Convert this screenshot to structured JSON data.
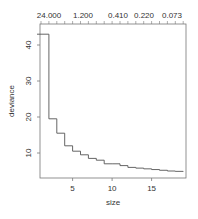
{
  "chart_data": {
    "type": "line",
    "subtype": "step",
    "title": "",
    "xlabel": "size",
    "ylabel": "deviance",
    "x_ticks": [
      5,
      10,
      15
    ],
    "y_ticks": [
      10,
      20,
      30,
      40
    ],
    "top_axis_labels": [
      "24.000",
      "1.200",
      "0.410",
      "0.220",
      "0.073"
    ],
    "xlim": [
      1,
      19.5
    ],
    "ylim": [
      3,
      45
    ],
    "grid": false,
    "x": [
      1,
      2,
      3,
      4,
      5,
      6,
      7,
      8,
      9,
      10,
      11,
      12,
      13,
      14,
      15,
      16,
      17,
      18,
      19
    ],
    "values": [
      43,
      19.5,
      15.5,
      12,
      10.5,
      9.5,
      8.5,
      8,
      7,
      7,
      6.5,
      6,
      5.8,
      5.6,
      5.4,
      5.2,
      5.0,
      4.9,
      4.8
    ]
  },
  "labels": {
    "xlabel": "size",
    "ylabel": "deviance",
    "x_ticks": [
      "5",
      "10",
      "15"
    ],
    "y_ticks": [
      "10",
      "20",
      "30",
      "40"
    ],
    "top": [
      "24.000",
      "1.200",
      "0.410",
      "0.220",
      "0.073"
    ]
  },
  "colors": {
    "line": "#555555",
    "frame": "#666666"
  }
}
